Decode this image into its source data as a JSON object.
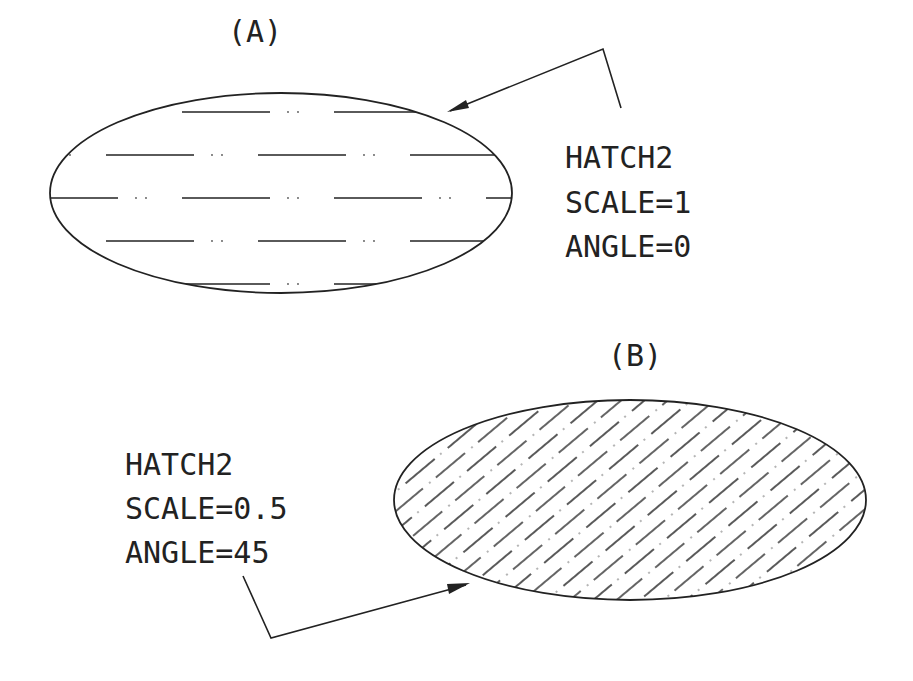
{
  "figure_a": {
    "title": "(A)",
    "label_lines": [
      "HATCH2",
      "SCALE=1",
      "ANGLE=0"
    ],
    "pattern": "HATCH2",
    "scale": 1,
    "angle": 0
  },
  "figure_b": {
    "title": "(B)",
    "label_lines": [
      "HATCH2",
      "SCALE=0.5",
      "ANGLE=45"
    ],
    "pattern": "HATCH2",
    "scale": 0.5,
    "angle": 45
  },
  "colors": {
    "stroke": "#222222",
    "background": "#ffffff"
  }
}
